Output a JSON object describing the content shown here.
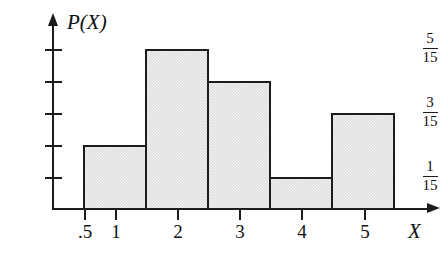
{
  "figure": {
    "type": "histogram",
    "y_axis_title": "P(X)",
    "x_axis_title": "X"
  },
  "y_axis": {
    "ticks": [
      {
        "value_num": "1",
        "value_den": "15",
        "labeled": true
      },
      {
        "value_num": "2",
        "value_den": "15",
        "labeled": false
      },
      {
        "value_num": "3",
        "value_den": "15",
        "labeled": true
      },
      {
        "value_num": "4",
        "value_den": "15",
        "labeled": false
      },
      {
        "value_num": "5",
        "value_den": "15",
        "labeled": true
      }
    ],
    "labels": [
      {
        "numerator": "5",
        "denominator": "15"
      },
      {
        "numerator": "3",
        "denominator": "15"
      },
      {
        "numerator": "1",
        "denominator": "15"
      }
    ]
  },
  "x_axis": {
    "tick_labels": [
      ".5",
      "1",
      "2",
      "3",
      "4",
      "5"
    ]
  },
  "chart_data": {
    "type": "bar",
    "title": "",
    "subtitle": "",
    "xlabel": "X",
    "ylabel": "P(X)",
    "categories": [
      "1",
      "2",
      "3",
      "4",
      "5"
    ],
    "bin_edges": [
      0.5,
      1.5,
      2.5,
      3.5,
      4.5,
      5.5
    ],
    "values": [
      0.1333,
      0.3333,
      0.2667,
      0.0667,
      0.2
    ],
    "value_labels": [
      "2/15",
      "5/15",
      "4/15",
      "1/15",
      "3/15"
    ],
    "value_numerators": [
      2,
      5,
      4,
      1,
      3
    ],
    "denominator": 15,
    "xlim": [
      0,
      5.9
    ],
    "ylim": [
      0,
      0.3889
    ],
    "ytick_values": [
      0.0667,
      0.1333,
      0.2,
      0.2667,
      0.3333
    ],
    "ytick_labels": [
      "1/15",
      "",
      "3/15",
      "",
      "5/15"
    ],
    "xtick_values": [
      0.5,
      1,
      2,
      3,
      4,
      5
    ],
    "xtick_labels": [
      ".5",
      "1",
      "2",
      "3",
      "4",
      "5"
    ],
    "grid": false,
    "legend": null,
    "bar_fill_color": "#dedede",
    "bar_edge_color": "#1c1c1c",
    "axis_color": "#1c1c1c"
  }
}
